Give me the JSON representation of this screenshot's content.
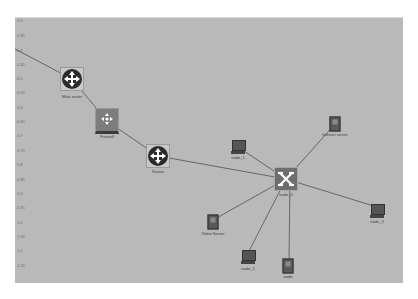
{
  "canvas": {
    "background": "#b9b9b9",
    "y_axis_ticks": [
      "0.3",
      "0.35",
      "0.4",
      "0.45",
      "0.5",
      "0.55",
      "0.6",
      "0.65",
      "0.7",
      "0.75",
      "0.8",
      "0.85",
      "0.9",
      "0.95",
      "1.0",
      "1.05",
      "1.1",
      "1.15"
    ]
  },
  "nodes": [
    {
      "id": "main_router",
      "label": "Main router",
      "type": "router",
      "x": 72,
      "y": 79
    },
    {
      "id": "firewall",
      "label": "Firewall",
      "type": "firewall",
      "x": 107,
      "y": 121
    },
    {
      "id": "router",
      "label": "Router",
      "type": "router",
      "x": 158,
      "y": 156
    },
    {
      "id": "node_0",
      "label": "node_0",
      "type": "switch",
      "x": 286,
      "y": 179
    },
    {
      "id": "node_1",
      "label": "node_1",
      "type": "pc",
      "x": 238,
      "y": 147
    },
    {
      "id": "internet_server",
      "label": "Internet server",
      "type": "server",
      "x": 335,
      "y": 124
    },
    {
      "id": "node_3",
      "label": "node_3",
      "type": "pc",
      "x": 377,
      "y": 211
    },
    {
      "id": "video_server",
      "label": "Video Server",
      "type": "server",
      "x": 213,
      "y": 222
    },
    {
      "id": "node_2",
      "label": "node_2",
      "type": "pc",
      "x": 248,
      "y": 257
    },
    {
      "id": "node",
      "label": "node",
      "type": "server",
      "x": 288,
      "y": 266
    }
  ],
  "links": [
    [
      "edge_left",
      "main_router"
    ],
    [
      "main_router",
      "firewall"
    ],
    [
      "firewall",
      "router"
    ],
    [
      "router",
      "node_0"
    ],
    [
      "node_0",
      "node_1"
    ],
    [
      "node_0",
      "internet_server"
    ],
    [
      "node_0",
      "node_3"
    ],
    [
      "node_0",
      "video_server"
    ],
    [
      "node_0",
      "node_2"
    ],
    [
      "node_0",
      "node"
    ]
  ]
}
